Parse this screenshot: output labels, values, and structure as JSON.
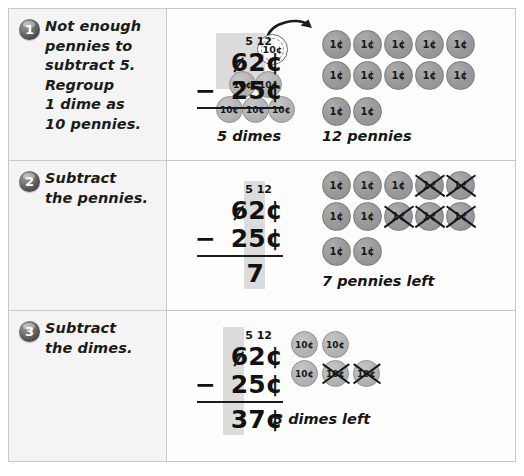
{
  "worksheet": {
    "title": "Subtracting money with regrouping",
    "steps": [
      {
        "number": "1",
        "instruction": "Not enough\npennies to\nsubtract 5.\nRegroup\n1 dime as\n10 pennies.",
        "math": {
          "regroup_tens": "5",
          "regroup_ones": "12",
          "minuend_tens": "6",
          "minuend_ones": "2",
          "minuend_unit": "¢",
          "operator": "−",
          "subtrahend_tens": "2",
          "subtrahend_ones": "5",
          "subtrahend_unit": "¢",
          "difference": "",
          "difference_unit": "",
          "highlight": "regrouped-top"
        },
        "coins": {
          "dime_label": "5 dimes",
          "penny_label": "12 pennies",
          "dimes_total": 5,
          "dimes_crossed": 0,
          "pennies_total": 12,
          "pennies_crossed": 0,
          "regrouped_dime_label": "10¢",
          "penny_face": "1¢",
          "dime_face": "10¢",
          "show_regroup_arrow": true
        }
      },
      {
        "number": "2",
        "instruction": "Subtract\nthe pennies.",
        "math": {
          "regroup_tens": "5",
          "regroup_ones": "12",
          "minuend_tens": "6",
          "minuend_ones": "2",
          "minuend_unit": "¢",
          "operator": "−",
          "subtrahend_tens": "2",
          "subtrahend_ones": "5",
          "subtrahend_unit": "¢",
          "difference": "7",
          "difference_unit": "",
          "highlight": "ones-column"
        },
        "coins": {
          "penny_label": "7 pennies left",
          "pennies_total": 12,
          "pennies_crossed": 5,
          "penny_face": "1¢"
        }
      },
      {
        "number": "3",
        "instruction": "Subtract\nthe dimes.",
        "math": {
          "regroup_tens": "5",
          "regroup_ones": "12",
          "minuend_tens": "6",
          "minuend_ones": "2",
          "minuend_unit": "¢",
          "operator": "−",
          "subtrahend_tens": "2",
          "subtrahend_ones": "5",
          "subtrahend_unit": "¢",
          "difference": "37",
          "difference_unit": "¢",
          "highlight": "tens-column"
        },
        "coins": {
          "dime_label": "3 dimes left",
          "dimes_total": 5,
          "dimes_crossed": 2,
          "dime_face": "10¢"
        }
      }
    ],
    "colors": {
      "penny": "#9b9b9b",
      "dime": "#b6b6b6",
      "highlight": "#dcdcdc",
      "badge": "#4a4a4a",
      "border": "#c8c8c8",
      "text": "#1b1b1b"
    }
  }
}
